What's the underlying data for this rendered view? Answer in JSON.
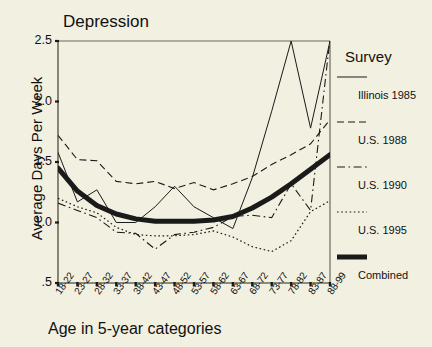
{
  "chart_data": {
    "type": "line",
    "title": "Depression",
    "xlabel": "Age in 5-year categories",
    "ylabel": "Average Days Per Week",
    "ylim": [
      0.5,
      2.5
    ],
    "yticks": [
      "2.5",
      "2.0",
      "1.5",
      "1.0",
      ".5"
    ],
    "ytick_values": [
      2.5,
      2.0,
      1.5,
      1.0,
      0.5
    ],
    "grid": false,
    "legend_position": "right",
    "legend_title": "Survey",
    "categories": [
      "18-22",
      "23-27",
      "28-32",
      "33-37",
      "38-42",
      "43-47",
      "48-52",
      "53-57",
      "58-62",
      "63-67",
      "68-72",
      "73-77",
      "78-82",
      "83-87",
      "88-99"
    ],
    "series": [
      {
        "name": "Illinois 1985",
        "style": "solid-thin",
        "values": [
          1.58,
          1.17,
          1.27,
          1.0,
          1.0,
          1.13,
          1.3,
          1.13,
          1.04,
          0.95,
          1.37,
          1.92,
          2.5,
          1.78,
          2.5
        ]
      },
      {
        "name": "U.S. 1988",
        "style": "dashed",
        "values": [
          1.72,
          1.52,
          1.51,
          1.34,
          1.32,
          1.34,
          1.28,
          1.33,
          1.27,
          1.32,
          1.38,
          1.48,
          1.56,
          1.65,
          1.85
        ]
      },
      {
        "name": "U.S. 1990",
        "style": "dash-dot",
        "values": [
          1.16,
          1.1,
          1.04,
          0.92,
          0.91,
          0.78,
          0.9,
          0.92,
          0.96,
          1.05,
          1.06,
          1.04,
          1.32,
          1.1,
          2.52
        ]
      },
      {
        "name": "U.S. 1995",
        "style": "dotted",
        "values": [
          1.2,
          1.13,
          1.08,
          0.96,
          0.9,
          0.89,
          0.89,
          0.9,
          0.93,
          0.88,
          0.8,
          0.76,
          0.85,
          1.09,
          1.18
        ]
      },
      {
        "name": "Combined",
        "style": "solid-thick",
        "values": [
          1.45,
          1.26,
          1.14,
          1.07,
          1.03,
          1.01,
          1.01,
          1.01,
          1.02,
          1.05,
          1.12,
          1.21,
          1.32,
          1.44,
          1.56
        ]
      }
    ]
  },
  "legend": {
    "title": "Survey",
    "items": [
      {
        "label": "Illinois 1985",
        "style": "solid-thin"
      },
      {
        "label": "U.S. 1988",
        "style": "dashed"
      },
      {
        "label": "U.S. 1990",
        "style": "dash-dot"
      },
      {
        "label": "U.S. 1995",
        "style": "dotted"
      },
      {
        "label": "Combined",
        "style": "solid-thick"
      }
    ]
  },
  "colors": {
    "background": "#f2f0e0",
    "ink": "#1a1a1a",
    "axis": "#6b6b5a"
  }
}
